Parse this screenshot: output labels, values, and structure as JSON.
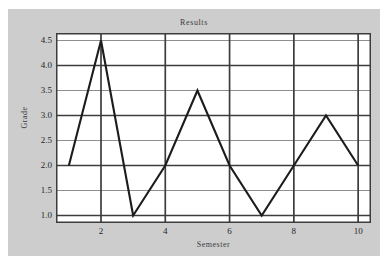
{
  "chart_data": {
    "type": "line",
    "title": "Results",
    "xlabel": "Semester",
    "ylabel": "Grade",
    "x": [
      1,
      2,
      3,
      4,
      5,
      6,
      7,
      8,
      9,
      10
    ],
    "values": [
      2.0,
      4.5,
      1.0,
      2.0,
      3.5,
      2.0,
      1.0,
      2.0,
      3.0,
      2.0
    ],
    "series": [
      {
        "name": "Grade",
        "values": [
          2.0,
          4.5,
          1.0,
          2.0,
          3.5,
          2.0,
          1.0,
          2.0,
          3.0,
          2.0
        ]
      }
    ],
    "xlim": [
      0.6,
      10.4
    ],
    "ylim": [
      0.85,
      4.65
    ],
    "xticks": [
      2,
      4,
      6,
      8,
      10
    ],
    "xtick_labels": [
      "2",
      "4",
      "6",
      "8",
      "10"
    ],
    "yticks": [
      1.0,
      1.5,
      2.0,
      2.5,
      3.0,
      3.5,
      4.0,
      4.5
    ],
    "ytick_labels": [
      "1.0",
      "1.5",
      "2.0",
      "2.5",
      "3.0",
      "3.5",
      "4.0",
      "4.5"
    ],
    "grid": {
      "horizontal": true,
      "vertical": true,
      "major_y": [
        1.0,
        2.0,
        3.0,
        4.0
      ],
      "minor_y": [
        1.5,
        2.5,
        3.5,
        4.5
      ],
      "vertical_x": [
        2,
        4,
        6,
        8,
        10
      ]
    },
    "legend": null,
    "colors": {
      "line": "#1c1c1c",
      "plot_background": "#ffffff",
      "figure_background": "#cdcdcd",
      "page_background": "#ffffff",
      "grid_major": "#3d3d3d",
      "grid_minor": "#8e8e8e",
      "text": "#262626"
    }
  }
}
